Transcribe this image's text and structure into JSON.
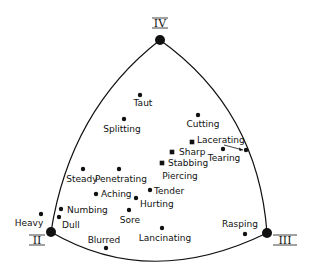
{
  "diagram": {
    "vertices": [
      {
        "id": "IV",
        "label": "IV",
        "x": 160,
        "y": 40,
        "lx": 160,
        "ly": 27
      },
      {
        "id": "II",
        "label": "II",
        "x": 51,
        "y": 232,
        "lx": 37,
        "ly": 244
      },
      {
        "id": "III",
        "label": "III",
        "x": 267,
        "y": 233,
        "lx": 285,
        "ly": 244
      }
    ],
    "points": [
      {
        "label": "Taut",
        "shape": "dot",
        "x": 140,
        "y": 95,
        "lx": 143,
        "ly": 106,
        "anchor": "middle"
      },
      {
        "label": "Splitting",
        "shape": "dot",
        "x": 124,
        "y": 119,
        "lx": 122,
        "ly": 132,
        "anchor": "middle"
      },
      {
        "label": "Cutting",
        "shape": "dot",
        "x": 198,
        "y": 115,
        "lx": 203,
        "ly": 127,
        "anchor": "middle"
      },
      {
        "label": "Lacerating",
        "shape": "square",
        "x": 192,
        "y": 142,
        "lx": 197,
        "ly": 143,
        "anchor": "start"
      },
      {
        "label": "Tearing",
        "shape": "dot",
        "x": 223,
        "y": 149,
        "lx": 224,
        "ly": 161,
        "anchor": "middle"
      },
      {
        "label": "Sharp",
        "shape": "square",
        "x": 172,
        "y": 152,
        "lx": 179,
        "ly": 155,
        "anchor": "start"
      },
      {
        "label": "Stabbing",
        "shape": "square",
        "x": 162,
        "y": 163,
        "lx": 168,
        "ly": 166,
        "anchor": "start"
      },
      {
        "label": "Piercing",
        "shape": "none",
        "x": 0,
        "y": 0,
        "lx": 180,
        "ly": 179,
        "anchor": "middle"
      },
      {
        "label": "Steady",
        "shape": "dot",
        "x": 83,
        "y": 169,
        "lx": 82,
        "ly": 182,
        "anchor": "middle"
      },
      {
        "label": "Penetrating",
        "shape": "dot",
        "x": 119,
        "y": 169,
        "lx": 121,
        "ly": 182,
        "anchor": "middle"
      },
      {
        "label": "Tender",
        "shape": "dot",
        "x": 150,
        "y": 190,
        "lx": 154,
        "ly": 194,
        "anchor": "start"
      },
      {
        "label": "Aching",
        "shape": "dot",
        "x": 96,
        "y": 194,
        "lx": 101,
        "ly": 197,
        "anchor": "start"
      },
      {
        "label": "Hurting",
        "shape": "dot",
        "x": 136,
        "y": 198,
        "lx": 140,
        "ly": 207,
        "anchor": "start"
      },
      {
        "label": "Sore",
        "shape": "dot",
        "x": 129,
        "y": 210,
        "lx": 130,
        "ly": 223,
        "anchor": "middle"
      },
      {
        "label": "Numbing",
        "shape": "dot",
        "x": 61,
        "y": 209,
        "lx": 67,
        "ly": 213,
        "anchor": "start"
      },
      {
        "label": "Dull",
        "shape": "dot",
        "x": 59,
        "y": 217,
        "lx": 62,
        "ly": 228,
        "anchor": "start"
      },
      {
        "label": "Heavy",
        "shape": "dot",
        "x": 41,
        "y": 214,
        "lx": 29,
        "ly": 226,
        "anchor": "middle"
      },
      {
        "label": "Blurred",
        "shape": "dot",
        "x": 106,
        "y": 248,
        "lx": 104,
        "ly": 243,
        "anchor": "middle"
      },
      {
        "label": "Lancinating",
        "shape": "dot",
        "x": 162,
        "y": 228,
        "lx": 165,
        "ly": 241,
        "anchor": "middle"
      },
      {
        "label": "Rasping",
        "shape": "dot",
        "x": 245,
        "y": 234,
        "lx": 240,
        "ly": 227,
        "anchor": "middle"
      }
    ],
    "extra_dot": {
      "x": 246,
      "y": 150
    },
    "arrow": {
      "from": [
        224,
        145
      ],
      "to": [
        243,
        150
      ]
    },
    "colors": {
      "ink": "#111111",
      "background": "#ffffff"
    }
  }
}
